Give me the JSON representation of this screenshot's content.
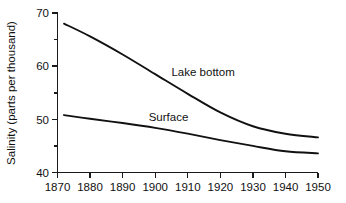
{
  "chart_data": {
    "type": "line",
    "title": "",
    "xlabel": "",
    "ylabel": "Salinity (parts per thousand)",
    "xlim": [
      1870,
      1950
    ],
    "ylim": [
      40,
      70
    ],
    "grid": false,
    "legend_position": "inline-labels",
    "x_ticks": [
      1870,
      1880,
      1890,
      1900,
      1910,
      1920,
      1930,
      1940,
      1950
    ],
    "x_tick_labels": [
      "1870",
      "1880",
      "1890",
      "1900",
      "1910",
      "1920",
      "1930",
      "1940",
      "1950"
    ],
    "y_ticks_major": [
      40,
      50,
      60,
      70
    ],
    "y_tick_labels": [
      "40",
      "50",
      "60",
      "70"
    ],
    "y_ticks_minor": [
      45,
      55,
      65
    ],
    "x": [
      1872,
      1880,
      1890,
      1900,
      1910,
      1920,
      1930,
      1940,
      1950
    ],
    "series": [
      {
        "name": "Lake bottom",
        "label": "Lake bottom",
        "values": [
          68.0,
          65.6,
          62.2,
          58.5,
          54.8,
          51.3,
          48.7,
          47.3,
          46.6
        ],
        "color": "#111111"
      },
      {
        "name": "Surface",
        "label": "Surface",
        "values": [
          50.8,
          50.1,
          49.3,
          48.4,
          47.3,
          46.1,
          45.0,
          44.0,
          43.6
        ],
        "color": "#111111"
      }
    ],
    "annotations": [
      {
        "text": "Lake bottom",
        "x": 1905,
        "y": 58.2
      },
      {
        "text": "Surface",
        "x": 1898,
        "y": 49.6
      }
    ]
  },
  "colors": {
    "background": "#ffffff",
    "axis": "#1a1a1a",
    "line": "#111111",
    "text": "#111111"
  }
}
